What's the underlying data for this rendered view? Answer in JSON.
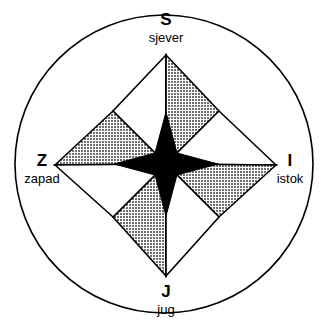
{
  "figure": {
    "background_color": "#ffffff",
    "outline_color": "#000000",
    "shade_color": "#9a9a9a",
    "dark_color": "#000000",
    "light_color": "#ffffff"
  },
  "circle": {
    "center_x": 164,
    "center_y": 164,
    "radius": 149,
    "stroke_width": 1.6
  },
  "labels": {
    "north": {
      "abbr": "S",
      "full": "sjever"
    },
    "south": {
      "abbr": "J",
      "full": "jug"
    },
    "west": {
      "abbr": "Z",
      "full": "zapad"
    },
    "east": {
      "abbr": "I",
      "full": "istok"
    }
  },
  "star": {
    "outer_points": [
      {
        "name": "north",
        "tip_x": 166,
        "tip_y": 55,
        "left_face": "light",
        "right_face": "shade"
      },
      {
        "name": "east",
        "tip_x": 276,
        "tip_y": 165,
        "left_face": "light",
        "right_face": "shade"
      },
      {
        "name": "south",
        "tip_x": 166,
        "tip_y": 276,
        "left_face": "shade",
        "right_face": "light"
      },
      {
        "name": "west",
        "tip_x": 55,
        "tip_y": 165,
        "left_face": "shade",
        "right_face": "light"
      }
    ],
    "inner_star": {
      "color": "#000000",
      "point_radius": 52,
      "waist_radius": 16
    }
  }
}
